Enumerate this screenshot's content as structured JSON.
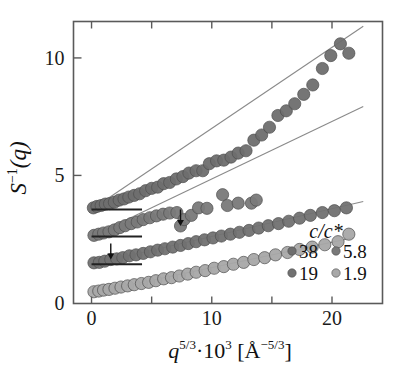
{
  "figure": {
    "background": "#ffffff",
    "frame_color": "#5a5a5a",
    "fit_line_color": "#8a8a8a"
  },
  "chart_data": {
    "type": "scatter",
    "title": "",
    "xlabel": "q^{5/3}·10^{3}  [Å^{-5/3}]",
    "ylabel": "S^{-1}(q)",
    "xlim": [
      -1.5,
      24.2
    ],
    "ylim": [
      -0.45,
      11.55
    ],
    "xticks": [
      0,
      5,
      10,
      15,
      20
    ],
    "xticklabels": [
      "0",
      "",
      "10",
      "",
      "20"
    ],
    "yticks": [
      0,
      5,
      10
    ],
    "yticklabels": [
      "0",
      "5",
      "10"
    ],
    "grid": false,
    "legend_position": "lower-right",
    "legend_title": "c/c*",
    "baseline_markers": [
      {
        "y": 3.55,
        "x_start": 0,
        "x_end": 4.2,
        "series": "38"
      },
      {
        "y": 2.4,
        "x_start": 0,
        "x_end": 4.2,
        "series": "5.8"
      },
      {
        "y": 1.22,
        "x_start": 0,
        "x_end": 4.2,
        "series": "19"
      }
    ],
    "annotations": [
      {
        "type": "arrow",
        "x": 7.4,
        "y_tip": 2.85,
        "y_tail": 3.55,
        "label": ""
      },
      {
        "type": "arrow",
        "x": 1.6,
        "y_tip": 1.42,
        "y_tail": 2.1,
        "label": ""
      }
    ],
    "series": [
      {
        "name": "38",
        "label": "38",
        "color": "#6e6e6e",
        "marker": "circle",
        "marker_size": 9,
        "offset": 3.55,
        "fit": {
          "intercept": 3.55,
          "slope": 0.345,
          "x_start": 0.0,
          "x_end": 22.6
        },
        "x": [
          0.15,
          0.45,
          0.8,
          1.15,
          1.5,
          1.9,
          2.3,
          2.7,
          3.1,
          3.55,
          4.0,
          4.5,
          5.0,
          5.5,
          6.0,
          6.5,
          7.05,
          7.6,
          8.1,
          8.7,
          9.25,
          9.8,
          10.4,
          11.0,
          11.6,
          12.2,
          12.85,
          13.5,
          14.15,
          14.8,
          15.5,
          16.2,
          16.9,
          17.65,
          18.4,
          19.2,
          19.9,
          20.7,
          21.4
        ],
        "y": [
          3.62,
          3.68,
          3.72,
          3.78,
          3.8,
          3.86,
          3.95,
          4.0,
          4.08,
          4.15,
          4.22,
          4.35,
          4.45,
          4.5,
          4.65,
          4.7,
          4.85,
          4.95,
          5.1,
          5.2,
          5.2,
          5.5,
          5.62,
          5.65,
          5.78,
          5.95,
          6.05,
          6.5,
          6.72,
          7.05,
          7.55,
          7.75,
          8.05,
          8.45,
          8.85,
          9.55,
          10.1,
          10.6,
          10.2
        ]
      },
      {
        "name": "5.8",
        "label": "5.8",
        "color": "#797979",
        "marker": "circle",
        "marker_size": 9,
        "offset": 2.4,
        "fit": {
          "intercept": 2.4,
          "slope": 0.245,
          "x_start": 0.0,
          "x_end": 22.6
        },
        "x": [
          0.2,
          0.6,
          1.0,
          1.45,
          1.9,
          2.35,
          2.8,
          3.3,
          3.8,
          4.3,
          4.85,
          5.4,
          5.95,
          6.5,
          7.1,
          7.4,
          7.7,
          8.3,
          8.9,
          9.6,
          10.9,
          11.3,
          12.2,
          13.3,
          13.7
        ],
        "y": [
          2.45,
          2.5,
          2.55,
          2.6,
          2.68,
          2.78,
          2.86,
          2.95,
          3.02,
          3.12,
          3.2,
          3.28,
          3.35,
          3.4,
          3.42,
          2.85,
          3.12,
          3.3,
          3.62,
          3.6,
          4.18,
          3.72,
          3.82,
          3.82,
          3.95
        ]
      },
      {
        "name": "19",
        "label": "19",
        "color": "#717171",
        "marker": "circle",
        "marker_size": 9,
        "offset": 1.22,
        "fit": {
          "intercept": 1.22,
          "slope": 0.118,
          "x_start": 0.0,
          "x_end": 22.6
        },
        "x": [
          0.2,
          0.65,
          1.1,
          1.6,
          2.1,
          2.6,
          3.15,
          3.7,
          4.3,
          4.9,
          5.5,
          6.1,
          6.75,
          7.4,
          8.05,
          8.7,
          9.4,
          10.1,
          10.8,
          11.55,
          12.3,
          13.1,
          13.9,
          14.7,
          15.55,
          16.4,
          17.3,
          18.2,
          19.2,
          20.2,
          21.2
        ],
        "y": [
          1.28,
          1.3,
          1.35,
          1.42,
          1.45,
          1.5,
          1.58,
          1.62,
          1.68,
          1.75,
          1.82,
          1.88,
          1.95,
          2.02,
          2.1,
          2.18,
          2.26,
          2.34,
          2.42,
          2.5,
          2.58,
          2.66,
          2.76,
          2.86,
          2.95,
          3.05,
          3.18,
          3.3,
          3.42,
          3.5,
          3.62
        ]
      },
      {
        "name": "1.9",
        "label": "1.9",
        "color": "#a8a8a8",
        "marker": "circle",
        "marker_size": 9,
        "offset": 0.0,
        "fit": {
          "intercept": 0.0,
          "slope": 0.108,
          "x_start": 0.0,
          "x_end": 21.8
        },
        "x": [
          0.2,
          0.6,
          1.0,
          1.45,
          1.95,
          2.45,
          3.0,
          3.55,
          4.15,
          4.75,
          5.35,
          6.0,
          6.65,
          7.3,
          8.0,
          8.7,
          9.45,
          10.2,
          11.0,
          11.8,
          12.65,
          13.5,
          14.4,
          15.3,
          16.3,
          17.3,
          18.35,
          19.4,
          20.5,
          21.4
        ],
        "y": [
          0.05,
          0.08,
          0.12,
          0.15,
          0.2,
          0.25,
          0.3,
          0.35,
          0.4,
          0.45,
          0.52,
          0.6,
          0.65,
          0.72,
          0.8,
          0.88,
          0.95,
          1.05,
          1.12,
          1.22,
          1.3,
          1.42,
          1.5,
          1.62,
          1.72,
          1.85,
          1.95,
          2.05,
          2.18,
          2.5
        ]
      }
    ],
    "legend": {
      "title": "c/c*",
      "entries": [
        {
          "label": "38",
          "color": "#6e6e6e"
        },
        {
          "label": "5.8",
          "color": "#797979"
        },
        {
          "label": "19",
          "color": "#717171"
        },
        {
          "label": "1.9",
          "color": "#a8a8a8"
        }
      ]
    }
  },
  "axis_text": {
    "y_label_S": "S",
    "y_label_exp": "−1",
    "y_label_q": "(q)",
    "x_label_q": "q",
    "x_label_q_exp": "5/3",
    "x_label_dot": "·",
    "x_label_ten": "10",
    "x_label_ten_exp": "3",
    "x_label_unit_open": "[Å",
    "x_label_unit_exp": "−5/3",
    "x_label_unit_close": "]"
  }
}
